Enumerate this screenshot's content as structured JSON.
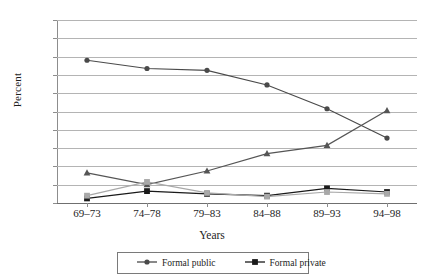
{
  "chart_data": {
    "type": "line",
    "title": "",
    "xlabel": "Years",
    "ylabel": "Percent",
    "ylim": [
      0,
      100
    ],
    "ytick_step": 10,
    "grid": true,
    "legend_position": "bottom",
    "categories": [
      "69–73",
      "74–78",
      "79–83",
      "84–88",
      "89–93",
      "94–98"
    ],
    "yticks": [
      "0",
      "10",
      "20",
      "30",
      "40",
      "50",
      "60",
      "70",
      "80",
      "90",
      "100"
    ],
    "series": [
      {
        "name": "Formal public",
        "marker": "circle",
        "color": "#4a4a4a",
        "values": [
          78,
          73.5,
          72.5,
          64.5,
          51.5,
          35.5
        ]
      },
      {
        "name": "Formal private",
        "marker": "square",
        "color": "#1a1a1a",
        "values": [
          2.5,
          6.5,
          5,
          4,
          8,
          6
        ]
      },
      {
        "name": "",
        "marker": "triangle",
        "color": "#555555",
        "values": [
          16.5,
          10,
          17.5,
          27,
          31.5,
          50.5
        ]
      },
      {
        "name": "",
        "marker": "square",
        "color": "#a8a8a8",
        "values": [
          4,
          11.5,
          5.5,
          3.5,
          6,
          5
        ]
      }
    ]
  },
  "legend": {
    "items": [
      {
        "label": "Formal public",
        "marker": "circle",
        "color": "#4a4a4a"
      },
      {
        "label": "Formal private",
        "marker": "square",
        "color": "#1a1a1a"
      }
    ]
  },
  "colors": {
    "axis": "#8d8d8d",
    "grid": "#b4b4b4",
    "text": "#1d1d1d",
    "background": "#ffffff"
  }
}
